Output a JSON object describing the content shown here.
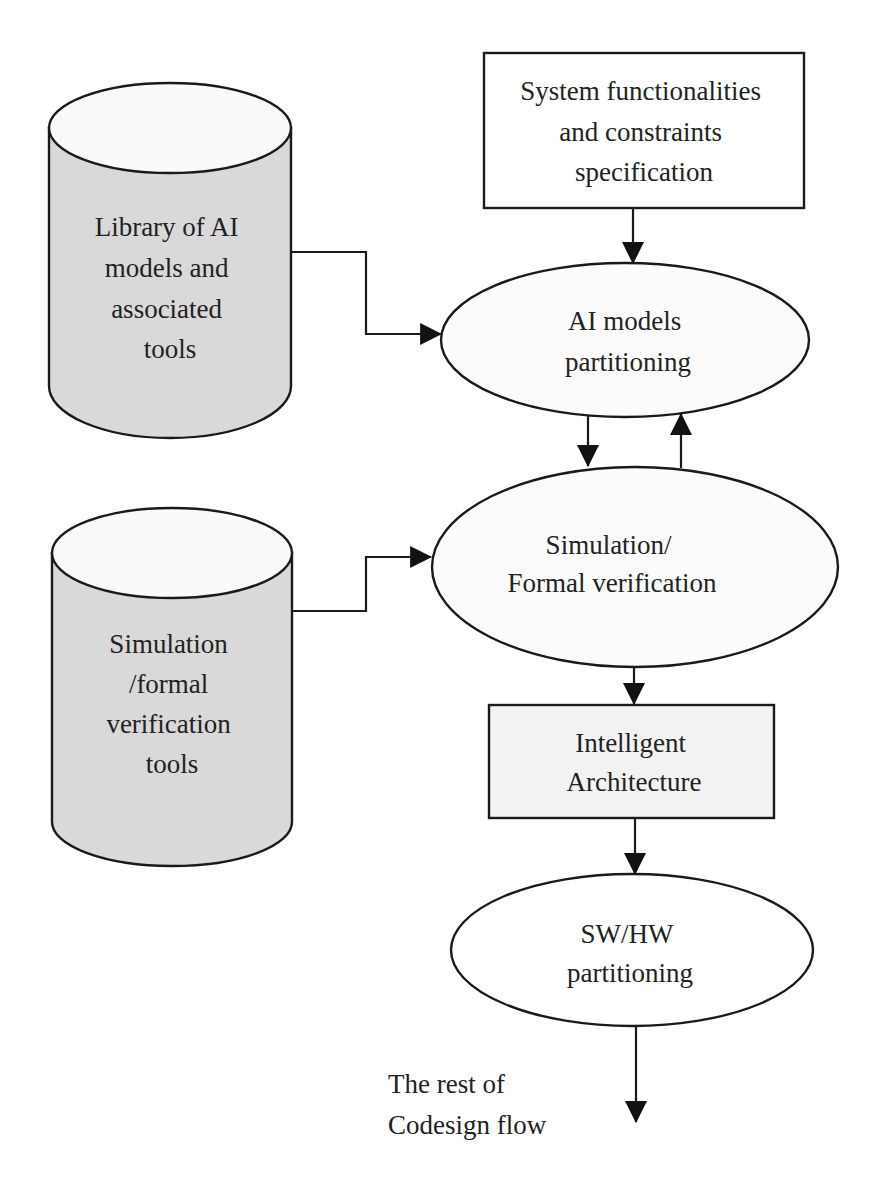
{
  "diagram": {
    "type": "flowchart",
    "colors": {
      "stroke": "#1a1a1a",
      "cylinder_body": "#d9d9d9",
      "cylinder_top": "#fafafa",
      "rect_fill": "#f2f2f2",
      "ellipse_fill": "#fbfbfb",
      "background": "#ffffff"
    },
    "nodes": {
      "spec_box": {
        "shape": "rectangle",
        "lines": [
          "System functionalities",
          "and constraints",
          "specification"
        ]
      },
      "ai_library": {
        "shape": "cylinder",
        "lines": [
          "Library of AI",
          "models and",
          "associated",
          "tools"
        ]
      },
      "ai_partitioning": {
        "shape": "ellipse",
        "lines": [
          "AI models",
          "partitioning"
        ]
      },
      "sim_tools": {
        "shape": "cylinder",
        "lines": [
          "Simulation",
          "/formal",
          "verification",
          "tools"
        ]
      },
      "sim_verification": {
        "shape": "ellipse",
        "lines": [
          "Simulation/",
          "Formal verification"
        ]
      },
      "intelligent_arch": {
        "shape": "rectangle",
        "lines": [
          "Intelligent",
          "Architecture"
        ]
      },
      "swhw_partitioning": {
        "shape": "ellipse",
        "lines": [
          "SW/HW",
          "partitioning"
        ]
      },
      "rest_of_flow": {
        "shape": "text",
        "lines": [
          "The rest of",
          "Codesign flow"
        ]
      }
    },
    "edges": [
      {
        "from": "spec_box",
        "to": "ai_partitioning"
      },
      {
        "from": "ai_library",
        "to": "ai_partitioning"
      },
      {
        "from": "ai_partitioning",
        "to": "sim_verification"
      },
      {
        "from": "sim_verification",
        "to": "ai_partitioning"
      },
      {
        "from": "sim_tools",
        "to": "sim_verification"
      },
      {
        "from": "sim_verification",
        "to": "intelligent_arch"
      },
      {
        "from": "intelligent_arch",
        "to": "swhw_partitioning"
      },
      {
        "from": "swhw_partitioning",
        "to": "rest_of_flow"
      }
    ]
  }
}
